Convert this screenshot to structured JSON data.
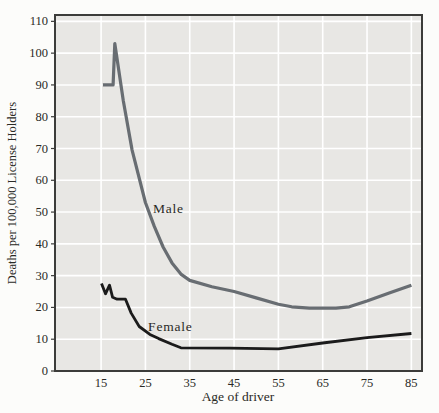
{
  "figure": {
    "xlabel": "Age of driver",
    "ylabel": "Deaths per 100,000 License Holders"
  },
  "colors": {
    "page_background": "#fcfcfa",
    "plot_background": "#e8e7e4",
    "gridline": "#ffffff",
    "axis_border": "#3c3c3a",
    "male_line": "#686d72",
    "female_line": "#1b1b1b",
    "text": "#2a2a26"
  },
  "chart_data": {
    "type": "line",
    "title": "",
    "xlabel": "Age of driver",
    "ylabel": "Deaths per 100,000 License Holders",
    "x_ticks": [
      15,
      25,
      35,
      45,
      55,
      65,
      75,
      85
    ],
    "y_ticks": [
      0,
      10,
      20,
      30,
      40,
      50,
      60,
      70,
      80,
      90,
      100,
      110
    ],
    "xlim": [
      4.6,
      87.4
    ],
    "ylim": [
      0,
      112
    ],
    "grid": true,
    "legend_position": "inline-annotations",
    "series": [
      {
        "name": "Male",
        "color": "#686d72",
        "stroke_width": 3.2,
        "label_anchor": {
          "age": 26.7,
          "value": 49.7
        },
        "points": [
          [
            15.4,
            90
          ],
          [
            17.7,
            90
          ],
          [
            18.1,
            103
          ],
          [
            20,
            85
          ],
          [
            22,
            69.5
          ],
          [
            25,
            53
          ],
          [
            27,
            45.5
          ],
          [
            29,
            39
          ],
          [
            31,
            34
          ],
          [
            33,
            30.5
          ],
          [
            35,
            28.5
          ],
          [
            40,
            26.5
          ],
          [
            45,
            25
          ],
          [
            50,
            23
          ],
          [
            55,
            21
          ],
          [
            58,
            20.2
          ],
          [
            62,
            19.8
          ],
          [
            68,
            19.8
          ],
          [
            71,
            20.2
          ],
          [
            75,
            22
          ],
          [
            80,
            24.5
          ],
          [
            85,
            27
          ]
        ]
      },
      {
        "name": "Female",
        "color": "#1b1b1b",
        "stroke_width": 2.8,
        "label_anchor": {
          "age": 25.6,
          "value": 12.6
        },
        "points": [
          [
            15.1,
            27.5
          ],
          [
            16,
            24.3
          ],
          [
            16.9,
            27
          ],
          [
            17.6,
            23.2
          ],
          [
            18.6,
            22.6
          ],
          [
            20.5,
            22.6
          ],
          [
            21.8,
            18.2
          ],
          [
            23.6,
            14
          ],
          [
            26,
            11.5
          ],
          [
            28,
            10.2
          ],
          [
            31,
            8.4
          ],
          [
            33,
            7.3
          ],
          [
            44,
            7.2
          ],
          [
            55,
            7
          ],
          [
            65,
            8.8
          ],
          [
            75,
            10.5
          ],
          [
            85,
            11.8
          ]
        ]
      }
    ]
  }
}
